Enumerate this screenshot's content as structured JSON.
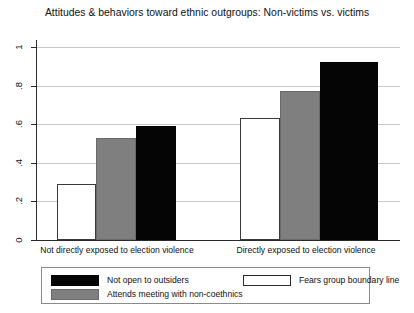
{
  "chart_data": {
    "type": "bar",
    "title": "Attitudes & behaviors toward ethnic outgroups: Non-victims vs. victims",
    "xlabel": "",
    "ylabel": "",
    "ylim": [
      0,
      1
    ],
    "grid": true,
    "legend_position": "bottom",
    "categories": [
      "Not directly exposed to election violence",
      "Directly exposed to election violence"
    ],
    "yticks": [
      "0",
      ".2",
      ".4",
      ".6",
      ".8",
      "1"
    ],
    "ytick_values": [
      0,
      0.2,
      0.4,
      0.6,
      0.8,
      1
    ],
    "series": [
      {
        "name": "Fears group boundary line",
        "color": "#ffffff",
        "values": [
          0.29,
          0.63
        ]
      },
      {
        "name": "Attends meeting with non-coethnics",
        "color": "#7f7f7f",
        "values": [
          0.53,
          0.77
        ]
      },
      {
        "name": "Not open to outsiders",
        "color": "#050505",
        "values": [
          0.59,
          0.92
        ]
      }
    ]
  },
  "legend": {
    "entries": [
      {
        "label": "Not open to outsiders",
        "swatch": "black"
      },
      {
        "label": "Fears group boundary line",
        "swatch": "white"
      },
      {
        "label": "Attends meeting with non-coethnics",
        "swatch": "gray"
      }
    ]
  }
}
